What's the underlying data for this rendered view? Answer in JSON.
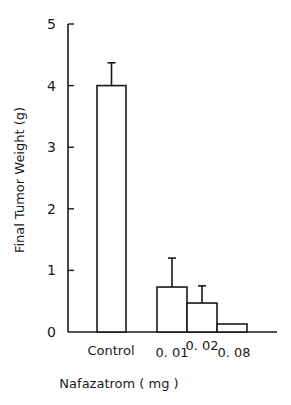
{
  "chart_data": {
    "type": "bar",
    "title": "",
    "xlabel": "Nafazatrom ( mg )",
    "ylabel": "Final Tumor Weight  (g)",
    "ylim": [
      0,
      5
    ],
    "yticks": [
      "0",
      "1",
      "2",
      "3",
      "4",
      "5"
    ],
    "grid": false,
    "legend": null,
    "categories": [
      "Control",
      "0.01",
      "0.02",
      "0.08"
    ],
    "values": [
      4.0,
      0.73,
      0.47,
      0.13
    ],
    "error_upper": [
      4.37,
      1.2,
      0.75,
      null
    ],
    "category_display": [
      "Control",
      "0. 01",
      "0. 02",
      "0. 08"
    ]
  }
}
